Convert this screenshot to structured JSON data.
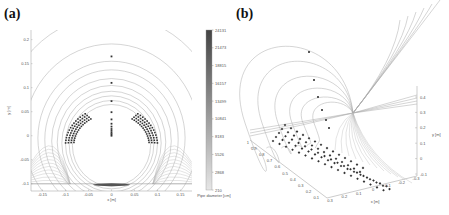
{
  "chart_data": [
    {
      "panel": "(a)",
      "type": "scatter",
      "title": "",
      "xlabel": "x [m]",
      "ylabel": "y [m]",
      "xlim": [
        -0.175,
        0.175
      ],
      "ylim": [
        -0.115,
        0.22
      ],
      "xticks": [
        "-0.15",
        "-0.1",
        "-0.05",
        "0",
        "0.05",
        "0.1",
        "0.15"
      ],
      "yticks": [
        "0.2",
        "0.15",
        "0.1",
        "0.05",
        "0",
        "-0.05",
        "-0.1"
      ],
      "grid": false,
      "description": "2D magnetic-field-like line curves forming concentric arcs around a circle, with pipe-position markers along the vertical axis and along two lower arcs",
      "vertical_markers_y": [
        0.165,
        0.11,
        0.072,
        0.049,
        0.034,
        0.025,
        0.019,
        0.014,
        0.01,
        0.006,
        0.003,
        0.0
      ],
      "colorbar": {
        "label": "Pipe diameter [cm]",
        "ticks": [
          "24131",
          "21473",
          "18815",
          "16157",
          "13499",
          "10841",
          "8183",
          "5526",
          "2868",
          "210"
        ],
        "range": [
          210,
          24131
        ]
      }
    },
    {
      "panel": "(b)",
      "type": "scatter",
      "title": "",
      "xlabel": "x [m]",
      "ylabel": "",
      "zlabel": "y [m]",
      "xticks": [
        "0.3",
        "0.2",
        "0.1",
        "0",
        "-0.1",
        "-0.2",
        "-0.3"
      ],
      "yticks": [
        "1",
        "0.9",
        "0.8",
        "0.7",
        "0.6",
        "0.5",
        "0.4",
        "0.3",
        "0.2",
        "0.1"
      ],
      "zticks": [
        "0.4",
        "0.3",
        "0.2",
        "0.1",
        "0",
        "-0.1"
      ],
      "grid": false,
      "description": "3D view of field lines converging to a point with rows of diamond markers receding in depth"
    }
  ],
  "labels": {
    "a": "(a)",
    "b": "(b)"
  }
}
